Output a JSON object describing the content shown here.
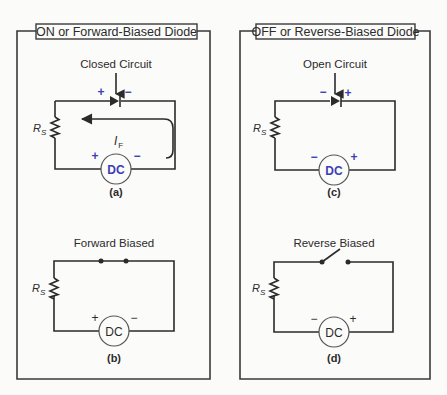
{
  "panels": [
    {
      "title": "ON or Forward-Biased Diode",
      "diagrams": [
        {
          "id": "a",
          "caption": "(a)",
          "label": "Closed Circuit",
          "resistor": "R",
          "resistor_sub": "S",
          "source": "DC",
          "source_plus": "+",
          "source_minus": "−",
          "diode_left": "+",
          "diode_right": "−",
          "current": "I",
          "current_sub": "F"
        },
        {
          "id": "b",
          "caption": "(b)",
          "label": "Forward Biased",
          "resistor": "R",
          "resistor_sub": "S",
          "source": "DC",
          "source_plus": "+",
          "source_minus": "−"
        }
      ]
    },
    {
      "title": "OFF or Reverse-Biased Diode",
      "diagrams": [
        {
          "id": "c",
          "caption": "(c)",
          "label": "Open Circuit",
          "resistor": "R",
          "resistor_sub": "S",
          "source": "DC",
          "source_minus": "−",
          "source_plus": "+",
          "diode_left": "−",
          "diode_right": "+"
        },
        {
          "id": "d",
          "caption": "(d)",
          "label": "Reverse Biased",
          "resistor": "R",
          "resistor_sub": "S",
          "source": "DC",
          "source_minus": "−",
          "source_plus": "+"
        }
      ]
    }
  ],
  "colors": {
    "accent_blue": "#3b3eb5",
    "line": "#2b2b2b",
    "background": "#fbfbfa"
  }
}
